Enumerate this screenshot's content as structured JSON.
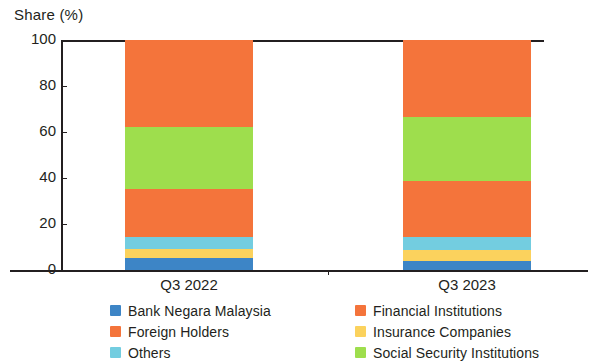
{
  "chart_data": {
    "type": "bar",
    "subtype": "stacked-bar-100",
    "title": "",
    "ylabel": "Share (%)",
    "xlabel": "",
    "categories": [
      "Q3 2022",
      "Q3 2023"
    ],
    "ylim": [
      0,
      100
    ],
    "yticks": [
      0,
      20,
      40,
      60,
      80,
      100
    ],
    "ytick_labels": [
      "0",
      "20",
      "40",
      "60",
      "80",
      "100"
    ],
    "grid": false,
    "legend_position": "bottom",
    "series": [
      {
        "name": "Bank Negara Malaysia",
        "color": "#3d85c6",
        "values": [
          5.2,
          4.0
        ]
      },
      {
        "name": "Insurance Companies",
        "color": "#fbd25d",
        "values": [
          4.0,
          4.8
        ]
      },
      {
        "name": "Others",
        "color": "#73cde0",
        "values": [
          5.2,
          5.6
        ]
      },
      {
        "name": "Financial Institutions",
        "color": "#f4743b",
        "values": [
          21.0,
          24.3
        ]
      },
      {
        "name": "Social Security Institutions",
        "color": "#9ede4d",
        "values": [
          26.6,
          27.8
        ]
      },
      {
        "name": "Foreign Holders",
        "color": "#f4743b",
        "values": [
          38.0,
          33.5
        ]
      }
    ],
    "legend_entries": [
      {
        "label": "Bank Negara Malaysia",
        "color": "#3d85c6"
      },
      {
        "label": "Financial Institutions",
        "color": "#f4743b"
      },
      {
        "label": "Foreign Holders",
        "color": "#f4743b"
      },
      {
        "label": "Insurance Companies",
        "color": "#fbd25d"
      },
      {
        "label": "Others",
        "color": "#73cde0"
      },
      {
        "label": "Social Security Institutions",
        "color": "#9ede4d"
      }
    ],
    "axis_color": "#231f20"
  }
}
